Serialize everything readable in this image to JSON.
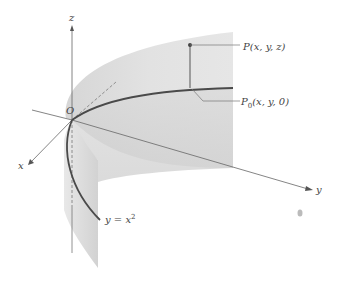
{
  "diagram": {
    "axes": {
      "z": {
        "label": "z"
      },
      "y": {
        "label": "y"
      },
      "x": {
        "label": "x"
      }
    },
    "origin_label": "O",
    "points": {
      "p": {
        "label": "P(x, y, z)"
      },
      "p0": {
        "label": "P",
        "sub": "0",
        "rest": "(x, y, 0)"
      }
    },
    "curve_label": {
      "base": "y = x",
      "sup": "2"
    },
    "colors": {
      "surface_light": "#e4e4e4",
      "surface_dark": "#cfcfcf",
      "curve": "#4a4a4a",
      "axis": "#666666",
      "text": "#444444"
    }
  }
}
